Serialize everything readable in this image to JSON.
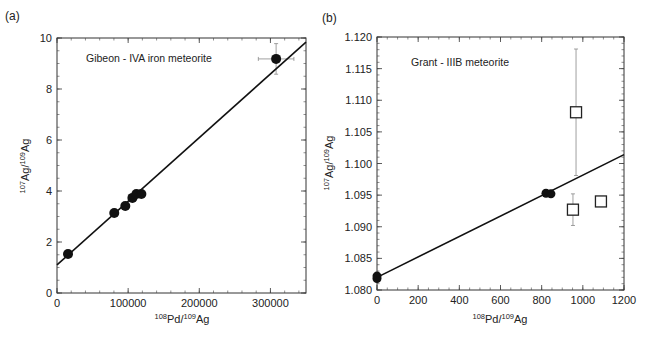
{
  "chart_data": [
    {
      "panel": "(a)",
      "type": "scatter",
      "title": "",
      "annotation": "Gibeon - IVA iron meteorite",
      "xlabel": "108Pd/109Ag",
      "ylabel": "107Ag/109Ag",
      "xlim": [
        0,
        350000
      ],
      "ylim": [
        0,
        10
      ],
      "xticks": [
        0,
        100000,
        200000,
        300000
      ],
      "xtick_labels": [
        "0",
        "100000",
        "200000",
        "300000"
      ],
      "yticks": [
        0,
        2,
        4,
        6,
        8,
        10
      ],
      "ytick_labels": [
        "0",
        "2",
        "4",
        "6",
        "8",
        "10"
      ],
      "grid": false,
      "legend": null,
      "series": [
        {
          "name": "Gibeon samples",
          "marker": "filled-circle",
          "points": [
            {
              "x": 15500,
              "y": 1.53
            },
            {
              "x": 80500,
              "y": 3.14
            },
            {
              "x": 96000,
              "y": 3.41
            },
            {
              "x": 106000,
              "y": 3.73
            },
            {
              "x": 111600,
              "y": 3.88
            },
            {
              "x": 118600,
              "y": 3.88
            },
            {
              "x": 308000,
              "y": 9.18,
              "xerr": 25000,
              "yerr": 0.6
            }
          ]
        },
        {
          "name": "Isochron fit",
          "type": "line",
          "x": [
            0,
            350000
          ],
          "y": [
            1.1,
            9.84
          ]
        }
      ]
    },
    {
      "panel": "(b)",
      "type": "scatter",
      "title": "",
      "annotation": "Grant - IIIB meteorite",
      "xlabel": "108Pd/109Ag",
      "ylabel": "107Ag/109Ag",
      "xlim": [
        0,
        1200
      ],
      "ylim": [
        1.08,
        1.12
      ],
      "xticks": [
        0,
        200,
        400,
        600,
        800,
        1000,
        1200
      ],
      "xtick_labels": [
        "0",
        "200",
        "400",
        "600",
        "800",
        "1000",
        "1200"
      ],
      "yticks": [
        1.08,
        1.085,
        1.09,
        1.095,
        1.1,
        1.105,
        1.11,
        1.115,
        1.12
      ],
      "ytick_labels": [
        "1.080",
        "1.085",
        "1.090",
        "1.095",
        "1.100",
        "1.105",
        "1.110",
        "1.115",
        "1.120"
      ],
      "grid": false,
      "legend": null,
      "series": [
        {
          "name": "Grant samples (filled)",
          "marker": "filled-circle",
          "points": [
            {
              "x": 0,
              "y": 1.0818
            },
            {
              "x": 0,
              "y": 1.0822
            },
            {
              "x": 821,
              "y": 1.0953
            },
            {
              "x": 845,
              "y": 1.0952
            }
          ]
        },
        {
          "name": "Grant samples (open)",
          "marker": "open-square",
          "points": [
            {
              "x": 967,
              "y": 1.1081,
              "yerr": 0.01
            },
            {
              "x": 952,
              "y": 1.0927,
              "yerr": 0.0025
            },
            {
              "x": 1088,
              "y": 1.094
            }
          ]
        },
        {
          "name": "Isochron fit",
          "type": "line",
          "x": [
            0,
            1200
          ],
          "y": [
            1.082,
            1.1014
          ]
        }
      ]
    }
  ],
  "labels": {
    "panel_a": "(a)",
    "panel_b": "(b)",
    "annot_a": "Gibeon - IVA iron meteorite",
    "annot_b": "Grant - IIIB meteorite",
    "x_sup1": "108",
    "x_main1": "Pd/",
    "x_sup2": "109",
    "x_main2": "Ag",
    "y_sup1": "107",
    "y_main1": "Ag/",
    "y_sup2": "109",
    "y_main2": "Ag"
  }
}
